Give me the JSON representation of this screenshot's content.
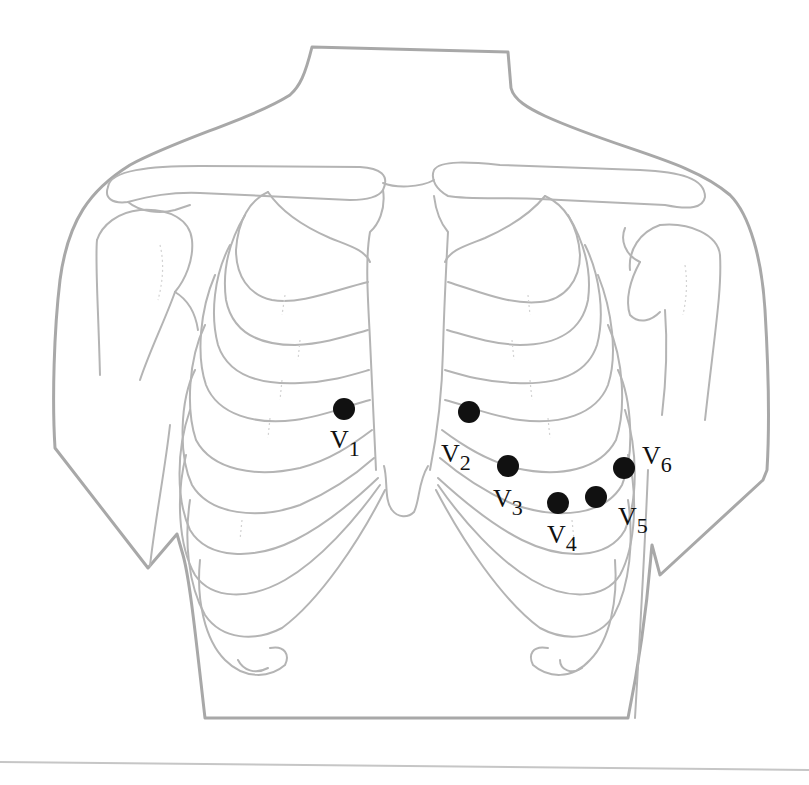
{
  "figure": {
    "colors": {
      "outline": "#a8a8a8",
      "bone": "#b4b4b4",
      "electrode": "#111111",
      "background": "#ffffff"
    }
  },
  "electrodes": [
    {
      "id": "V1",
      "letter": "V",
      "sub": "1",
      "cx": 344,
      "cy": 409,
      "lx": 330,
      "ly": 448
    },
    {
      "id": "V2",
      "letter": "V",
      "sub": "2",
      "cx": 469,
      "cy": 412,
      "lx": 441,
      "ly": 462
    },
    {
      "id": "V3",
      "letter": "V",
      "sub": "3",
      "cx": 508,
      "cy": 466,
      "lx": 493,
      "ly": 507
    },
    {
      "id": "V4",
      "letter": "V",
      "sub": "4",
      "cx": 558,
      "cy": 503,
      "lx": 547,
      "ly": 543
    },
    {
      "id": "V5",
      "letter": "V",
      "sub": "5",
      "cx": 596,
      "cy": 497,
      "lx": 618,
      "ly": 525
    },
    {
      "id": "V6",
      "letter": "V",
      "sub": "6",
      "cx": 624,
      "cy": 468,
      "lx": 642,
      "ly": 464
    }
  ]
}
